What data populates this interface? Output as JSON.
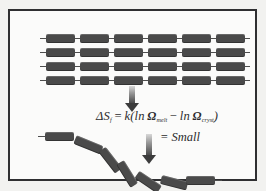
{
  "figure": {
    "background_color": "#f2f2f0",
    "panel_color": "#fbfbfa",
    "border_color": "#2f2f31",
    "segment_color": "#4a4a4a",
    "text_color": "#2b2b2d"
  },
  "crystal": {
    "label": "crystalline-lattice",
    "rows": 4,
    "segments_per_row": 6,
    "row_tops": [
      0,
      14,
      28,
      42
    ],
    "segment_lefts": [
      6,
      40,
      74,
      108,
      142,
      176
    ]
  },
  "arrows": [
    {
      "name": "arrow-melting",
      "direction": "down"
    },
    {
      "name": "arrow-result",
      "direction": "down"
    }
  ],
  "equation": {
    "delta": "Δ",
    "symbol": "S",
    "subscript": "f",
    "equals": "=",
    "constant": "k",
    "open_paren": "(",
    "ln1": "ln",
    "omega1": "Ω",
    "omega1_sub": "melt",
    "minus": "−",
    "ln2": "ln",
    "omega2": "Ω",
    "omega2_sub": "cryst",
    "close_paren": ")",
    "result_equals": "=",
    "result_value": "Small",
    "plain_text": "ΔS_f = k(ln Ω_melt − ln Ω_cryst) = Small"
  },
  "amorphous": {
    "label": "amorphous-coil",
    "segments": [
      {
        "left": 5,
        "top": 6,
        "width": 29,
        "angle": 0
      },
      {
        "left": 35,
        "top": 9,
        "width": 29,
        "angle": 22
      },
      {
        "left": 62,
        "top": 19,
        "width": 27,
        "angle": 52
      },
      {
        "left": 80,
        "top": 32,
        "width": 27,
        "angle": 58
      },
      {
        "left": 97,
        "top": 44,
        "width": 27,
        "angle": 34
      },
      {
        "left": 121,
        "top": 49,
        "width": 27,
        "angle": 14
      },
      {
        "left": 146,
        "top": 50,
        "width": 29,
        "angle": 0
      }
    ]
  }
}
